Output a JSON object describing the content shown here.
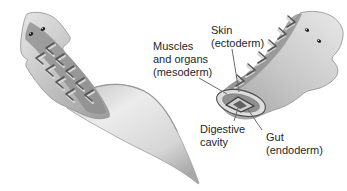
{
  "diagram": {
    "labels": {
      "skin": "Skin\n(ectoderm)",
      "muscles": "Muscles\nand organs\n(mesoderm)",
      "digestive_cavity": "Digestive\ncavity",
      "gut": "Gut\n(endoderm)"
    },
    "graphics": {
      "left_worm": "whole-flatworm",
      "right_worm": "sectioned-flatworm-showing-tissue-layers"
    },
    "colors": {
      "background": "#ffffff",
      "label_text": "#1f1f1f",
      "leader_line": "#6b6b6b",
      "body_light": "#e6e6e6",
      "body_shadow": "#9c9c9c",
      "dorsal_stripe": "#8d8d8d",
      "chevron_dark": "#565656",
      "chevron_light": "#d8d8d8",
      "cut_skin_rim": "#dedede",
      "cut_mesoderm": "#909090",
      "gut_wall": "#cdcdcd",
      "gut_outline": "#383838",
      "cavity_fill": "#606060"
    }
  }
}
